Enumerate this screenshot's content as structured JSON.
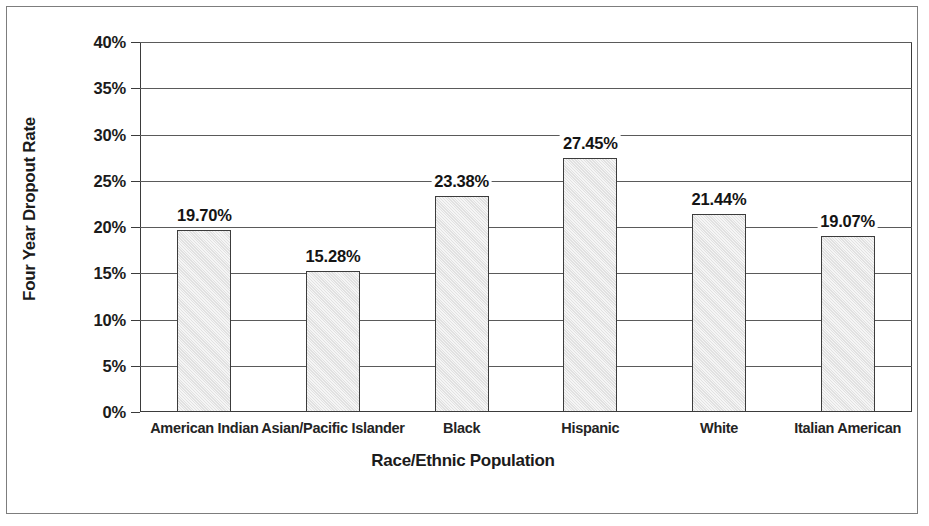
{
  "chart_data": {
    "type": "bar",
    "title": "",
    "xlabel": "Race/Ethnic Population",
    "ylabel": "Four Year Dropout Rate",
    "categories": [
      "American Indian",
      "Asian/Pacific Islander",
      "Black",
      "Hispanic",
      "White",
      "Italian American"
    ],
    "values": [
      19.7,
      15.28,
      23.38,
      27.45,
      21.44,
      19.07
    ],
    "value_labels": [
      "19.70%",
      "15.28%",
      "23.38%",
      "27.45%",
      "21.44%",
      "19.07%"
    ],
    "ylim": [
      0,
      40
    ],
    "ytick_values": [
      0,
      5,
      10,
      15,
      20,
      25,
      30,
      35,
      40
    ],
    "ytick_labels": [
      "0%",
      "5%",
      "10%",
      "15%",
      "20%",
      "25%",
      "30%",
      "35%",
      "40%"
    ],
    "grid": true,
    "legend": false,
    "bar_fill_color": "#e9e9e9",
    "bar_border_color": "#3c3c3c",
    "gridline_color": "#5a5a5a",
    "axis_color": "#3b3b3b",
    "text_color": "#1b1b1b",
    "frame_color": "#7d7d7d"
  }
}
